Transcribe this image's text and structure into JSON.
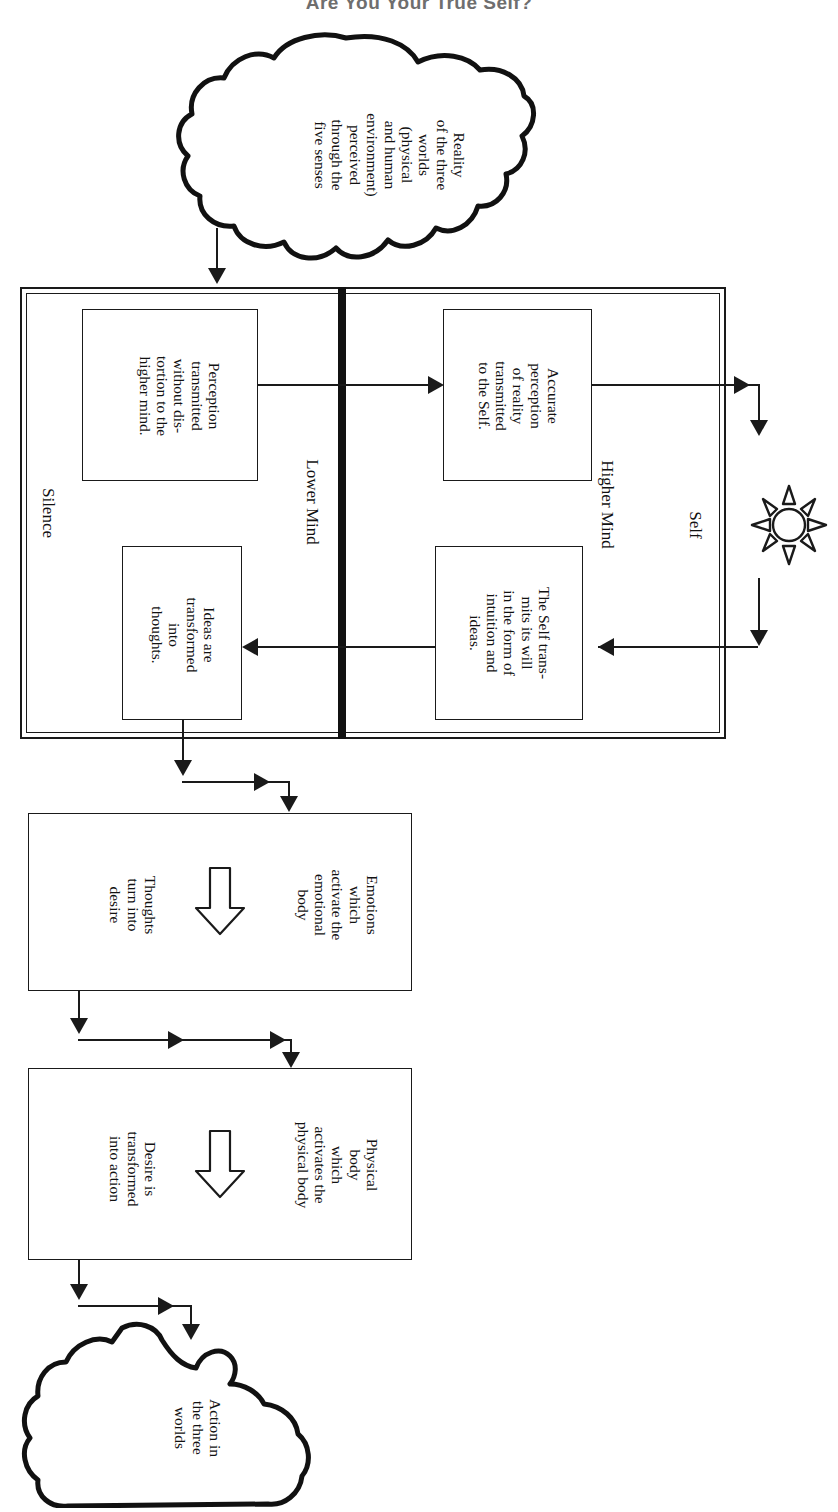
{
  "title": "Are You Your True Self?",
  "clouds": {
    "source": {
      "name": "reality-cloud",
      "text": "Reality\nof the three\nworlds\n(physical\nand human\nenvironment)\nperceived\nthrough the\nfive senses"
    },
    "result": {
      "name": "action-cloud",
      "text": "Action in\nthe three\nworlds"
    }
  },
  "mind_frame": {
    "left_label": "Lower Mind",
    "right_label": "Higher Mind",
    "silence_label": "Silence",
    "self_label": "Self",
    "self_icon": "sun-icon",
    "boxes": {
      "perception": "Perception\ntransmitted\nwithout dis-\ntortion to the\nhigher mind.",
      "accurate_perception": "Accurate\nperception\nof reality\ntransmitted\nto the Self.",
      "self_transmits": "The Self trans-\nmits its will\nin the form of\nintuition and\nideas.",
      "ideas_transformed": "Ideas are\ntransformed\ninto\nthoughts."
    }
  },
  "stages": [
    {
      "name": "emotional-body",
      "head": "Emotions\nwhich\nactivate the\nemotional\nbody",
      "arrow_icon": "block-arrow-icon",
      "tail": "Thoughts\nturn into\ndesire"
    },
    {
      "name": "physical-body",
      "head": "Physical\nbody\nwhich\nactivates the\nphysical body",
      "arrow_icon": "block-arrow-icon",
      "tail": "Desire is\ntransformed\ninto action"
    }
  ],
  "colors": {
    "ink": "#1a1a1a",
    "paper": "#ffffff",
    "title": "#6e6e6e"
  }
}
